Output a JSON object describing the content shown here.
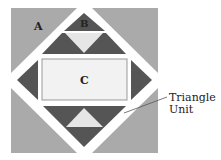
{
  "diagram": {
    "labels": {
      "a": "A",
      "b": "B",
      "c": "C"
    },
    "callout": {
      "line1": "Triangle",
      "line2": "Unit"
    },
    "colors": {
      "background": "#ffffff",
      "corner_fill": "#aaaaaa",
      "dark_fill": "#555555",
      "light_fill": "#e6e6e6",
      "center_fill": "#f2f2f2",
      "center_border": "#999999",
      "text": "#222222",
      "leader_line": "#555555"
    }
  }
}
